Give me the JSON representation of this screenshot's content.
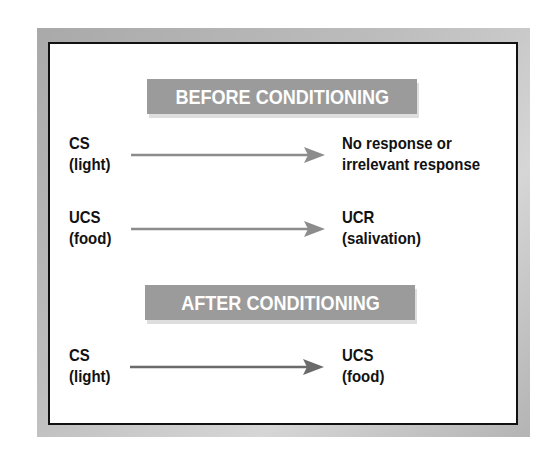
{
  "diagram": {
    "type": "classical-conditioning",
    "colors": {
      "frame_gray": "#b5b5b5",
      "border": "#111111",
      "banner_bg": "#9b9b9b",
      "banner_text": "#ffffff",
      "arrow_light": "#8c8c8c",
      "arrow_dark": "#6a6a6a",
      "text": "#111111"
    },
    "sections": [
      {
        "title": "BEFORE CONDITIONING",
        "rows": [
          {
            "stimulus": {
              "line1": "CS",
              "line2": "(light)"
            },
            "response": {
              "line1": "No response or",
              "line2": "irrelevant response"
            }
          },
          {
            "stimulus": {
              "line1": "UCS",
              "line2": "(food)"
            },
            "response": {
              "line1": "UCR",
              "line2": "(salivation)"
            }
          }
        ]
      },
      {
        "title": "AFTER CONDITIONING",
        "rows": [
          {
            "stimulus": {
              "line1": "CS",
              "line2": "(light)"
            },
            "response": {
              "line1": "UCS",
              "line2": "(food)"
            }
          }
        ]
      }
    ]
  }
}
